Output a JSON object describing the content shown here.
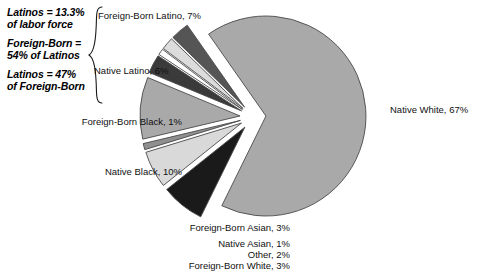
{
  "figure": {
    "background": "#ffffff",
    "annotations": [
      {
        "name": "latino-share-note",
        "text": "Latinos = 13.3%\nof labor force"
      },
      {
        "name": "foreign-born-note",
        "text": "Foreign-Born =\n54% of Latinos"
      },
      {
        "name": "latino-of-foreign-note",
        "text": "Latinos = 47%\nof Foreign-Born"
      }
    ],
    "brace": "}"
  },
  "chart_data": {
    "type": "pie",
    "title": "",
    "exploded": true,
    "start_angle_deg": 235,
    "direction": "clockwise",
    "categories": [
      "Native White",
      "Foreign-Born Latino",
      "Native Latino",
      "Foreign-Born Black",
      "Native Black",
      "Foreign-Born Asian",
      "Native Asian",
      "Other",
      "Foreign-Born White"
    ],
    "values": [
      67,
      7,
      6,
      1,
      10,
      3,
      1,
      2,
      3
    ],
    "labels": [
      "Native White, 67%",
      "Foreign-Born Latino, 7%",
      "Native Latino, 6%",
      "Foreign-Born Black, 1%",
      "Native Black, 10%",
      "Foreign-Born Asian, 3%",
      "Native Asian, 1%",
      "Other, 2%",
      "Foreign-Born White, 3%"
    ],
    "colors": [
      "#a9a9a9",
      "#1a1a1a",
      "#d9d9d9",
      "#8f8f8f",
      "#a9a9a9",
      "#3a3a3a",
      "#ffffff",
      "#dcdcdc",
      "#555555"
    ],
    "edge_color": "#4a4a4a",
    "label_positions": [
      {
        "x": 390,
        "y": 104,
        "align": "left"
      },
      {
        "x": 98,
        "y": 10,
        "align": "left"
      },
      {
        "x": 94,
        "y": 65,
        "align": "left"
      },
      {
        "x": 182,
        "y": 116,
        "align": "right"
      },
      {
        "x": 182,
        "y": 166,
        "align": "right"
      },
      {
        "x": 290,
        "y": 222,
        "align": "right"
      },
      {
        "x": 290,
        "y": 238,
        "align": "right"
      },
      {
        "x": 290,
        "y": 249,
        "align": "right"
      },
      {
        "x": 290,
        "y": 260,
        "align": "right"
      }
    ]
  }
}
